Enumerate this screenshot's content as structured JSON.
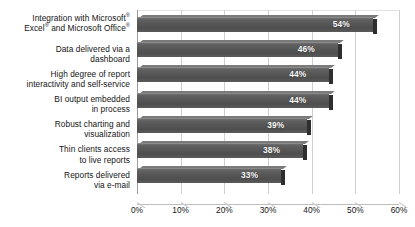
{
  "chart_data": {
    "type": "bar",
    "orientation": "horizontal",
    "title": "",
    "xlabel": "",
    "ylabel": "",
    "xlim": [
      0,
      60
    ],
    "xticks": [
      "0%",
      "10%",
      "20%",
      "30%",
      "40%",
      "50%",
      "60%"
    ],
    "xtick_values": [
      0,
      10,
      20,
      30,
      40,
      50,
      60
    ],
    "grid": true,
    "legend": null,
    "value_suffix": "%",
    "categories": [
      "Integration with Microsoft® Excel® and Microsoft Office®",
      "Data delivered via a dashboard",
      "High degree of report interactivity and self-service",
      "BI output embedded in process",
      "Robust charting and visualization",
      "Thin clients access to live reports",
      "Reports delivered via e-mail"
    ],
    "values": [
      54,
      46,
      44,
      44,
      39,
      38,
      33
    ],
    "data_labels": [
      "54%",
      "46%",
      "44%",
      "44%",
      "39%",
      "38%",
      "33%"
    ],
    "colors": {
      "bar_fill": "#565656",
      "bar_side": "#2e2e2e",
      "bar_top": "#7a7a7a",
      "gridline": "#d0d0d0",
      "axis": "#9a9a9a",
      "label_text": "#151515",
      "value_text": "#ffffff",
      "background": "#ffffff"
    }
  },
  "category_label_lines": [
    [
      "Integration with Microsoft",
      "Excel",
      " and Microsoft Office"
    ],
    [
      "Data delivered via a",
      "dashboard"
    ],
    [
      "High degree of report",
      "interactivity and self-service"
    ],
    [
      "BI output embedded",
      "in process"
    ],
    [
      "Robust charting and",
      "visualization"
    ],
    [
      "Thin clients access",
      "to live reports"
    ],
    [
      "Reports delivered",
      "via e-mail"
    ]
  ],
  "title_remnant": ""
}
